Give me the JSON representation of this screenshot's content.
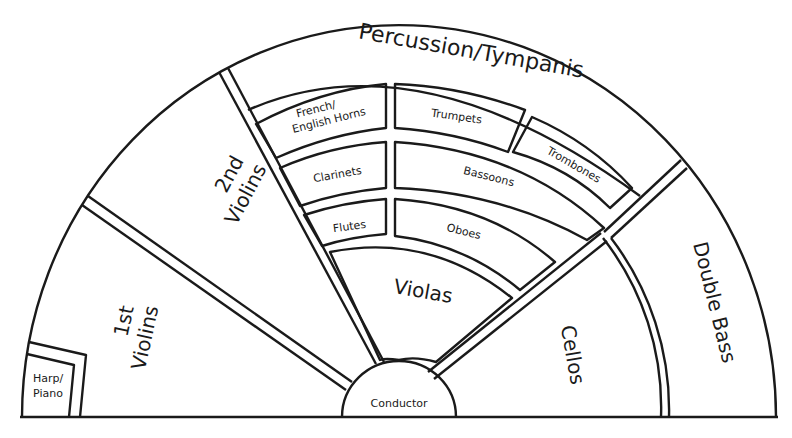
{
  "colors": {
    "stroke": "#1a1a1a",
    "background": "#ffffff"
  },
  "sections": {
    "percussion": "Percussion/Tympanis",
    "first_violins": [
      "1st",
      "Violins"
    ],
    "second_violins": [
      "2nd",
      "Violins"
    ],
    "violas": "Violas",
    "cellos": "Cellos",
    "double_bass": "Double Bass",
    "harp_piano": [
      "Harp/",
      "Piano"
    ],
    "conductor": "Conductor",
    "french_horns": [
      "French/",
      "English Horns"
    ],
    "clarinets": "Clarinets",
    "flutes": "Flutes",
    "trumpets": "Trumpets",
    "bassoons": "Bassoons",
    "oboes": "Oboes",
    "trombones": "Trombones"
  }
}
